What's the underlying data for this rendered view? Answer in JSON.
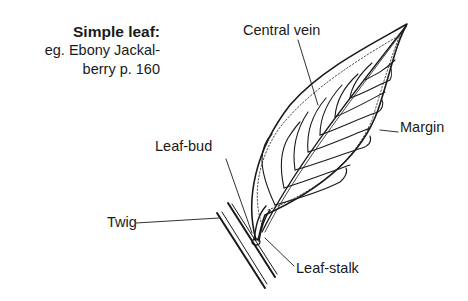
{
  "caption": {
    "title": "Simple leaf:",
    "line1": "eg. Ebony Jackal-",
    "line2": "berry p. 160"
  },
  "labels": {
    "central_vein": "Central vein",
    "margin": "Margin",
    "leaf_bud": "Leaf-bud",
    "twig": "Twig",
    "leaf_stalk": "Leaf-stalk"
  },
  "colors": {
    "ink": "#1a1a1a",
    "background": "#ffffff"
  }
}
